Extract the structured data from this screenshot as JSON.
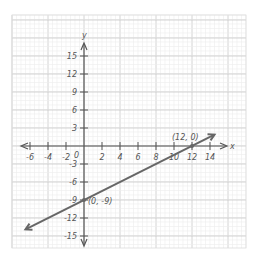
{
  "chart_data": {
    "type": "line",
    "title": "",
    "xlabel": "x",
    "ylabel": "y",
    "xlim": [
      -8,
      16
    ],
    "ylim": [
      -18,
      18
    ],
    "grid": true,
    "x_ticks": [
      -6,
      -4,
      -2,
      2,
      4,
      6,
      8,
      10,
      12,
      14
    ],
    "x_tick_labels": [
      "-6",
      "-4",
      "-2",
      "2",
      "4",
      "6",
      "8",
      "10",
      "12",
      "14"
    ],
    "y_ticks": [
      15,
      12,
      9,
      6,
      3,
      -3,
      -6,
      -9,
      -12,
      -15
    ],
    "y_tick_labels": [
      "15",
      "12",
      "9",
      "6",
      "3",
      "-3",
      "-6",
      "-9",
      "-12",
      "-15"
    ],
    "origin_label": "0",
    "series": [
      {
        "name": "line",
        "x": [
          -6.5,
          14.5
        ],
        "y": [
          -13.9,
          1.9
        ],
        "color": "#666666"
      }
    ],
    "points": [
      {
        "x": 12,
        "y": 0,
        "label": "(12, 0)"
      },
      {
        "x": 0,
        "y": -9,
        "label": "(0, -9)"
      }
    ]
  }
}
